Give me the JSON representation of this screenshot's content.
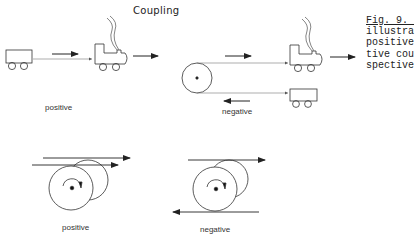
{
  "figure": {
    "title": "Coupling",
    "caption_lines": [
      "Fig. 9. ",
      "illustra",
      "positive",
      "tive cou",
      "spective"
    ],
    "top_row": {
      "positive_label": "positive",
      "negative_label": "negative"
    },
    "bottom_row": {
      "positive_label": "positive",
      "negative_label": "negative"
    },
    "icons": [
      "train-car-icon",
      "locomotive-icon",
      "pulley-icon",
      "roller-icon",
      "arrow-icon"
    ],
    "colors": {
      "ink": "#222222",
      "background": "#ffffff"
    }
  }
}
